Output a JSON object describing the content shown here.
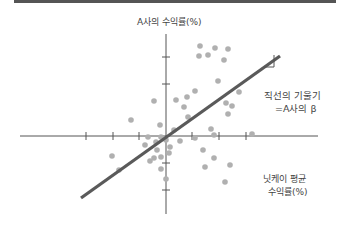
{
  "chart_data": {
    "type": "scatter",
    "title": "",
    "ylabel": "A사의 수익률(%)",
    "xlabel": "닛케이 평균 수익률(%)",
    "xlabel_lines": [
      "닛케이 평균",
      "수익률(%)"
    ],
    "annotation_lines": [
      "직선의 기울기",
      "=A사의 β"
    ],
    "grid": false,
    "legend": null,
    "colors": {
      "axis": "#555555",
      "points": "#b0b0b0",
      "regression_line": "#5a5a5a",
      "text": "#444444"
    },
    "axes_pixel": {
      "origin": [
        166,
        136
      ],
      "x_range_px": [
        20,
        318
      ],
      "y_range_px": [
        34,
        214
      ],
      "x_ticks_px": [
        86,
        113,
        139,
        192,
        219,
        246
      ],
      "y_ticks_px": [
        57,
        84,
        163,
        190
      ]
    },
    "regression_line_px": {
      "x1": 81,
      "y1": 198,
      "x2": 280,
      "y2": 56
    },
    "slope_triangle_px": {
      "x1": 264,
      "y1": 67,
      "x2": 274,
      "y2": 67,
      "x3": 274,
      "y3": 55
    },
    "points_px": [
      [
        200,
        46
      ],
      [
        215,
        48
      ],
      [
        208,
        55
      ],
      [
        228,
        49
      ],
      [
        199,
        56
      ],
      [
        224,
        60
      ],
      [
        154,
        101
      ],
      [
        218,
        81
      ],
      [
        195,
        91
      ],
      [
        187,
        97
      ],
      [
        239,
        92
      ],
      [
        176,
        100
      ],
      [
        184,
        107
      ],
      [
        232,
        106
      ],
      [
        188,
        117
      ],
      [
        131,
        120
      ],
      [
        160,
        125
      ],
      [
        226,
        103
      ],
      [
        228,
        114
      ],
      [
        148,
        137
      ],
      [
        161,
        137
      ],
      [
        174,
        130
      ],
      [
        145,
        145
      ],
      [
        156,
        142
      ],
      [
        166,
        140
      ],
      [
        170,
        147
      ],
      [
        169,
        153
      ],
      [
        180,
        141
      ],
      [
        214,
        135
      ],
      [
        211,
        129
      ],
      [
        252,
        134
      ],
      [
        203,
        150
      ],
      [
        214,
        158
      ],
      [
        205,
        167
      ],
      [
        230,
        165
      ],
      [
        225,
        182
      ],
      [
        157,
        150
      ],
      [
        161,
        157
      ],
      [
        150,
        161
      ],
      [
        161,
        169
      ],
      [
        166,
        179
      ],
      [
        154,
        158
      ],
      [
        112,
        156
      ],
      [
        119,
        170
      ],
      [
        195,
        138
      ]
    ]
  }
}
